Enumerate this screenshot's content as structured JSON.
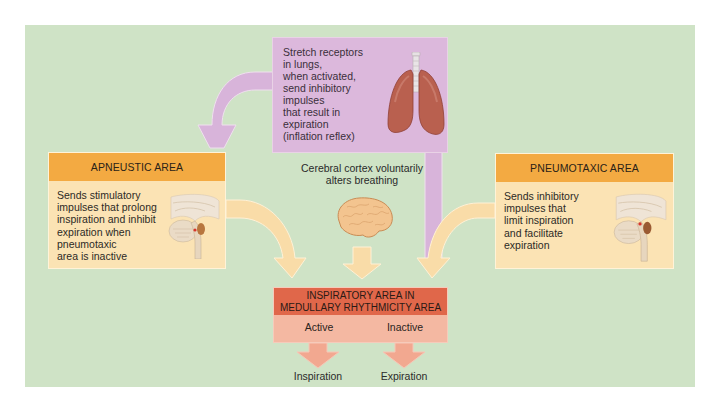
{
  "diagram": {
    "type": "flowchart",
    "topic": "Regulation of breathing by brain stem respiratory centers",
    "colors": {
      "panel_background": "#cfe3c6",
      "stretch_receptor_box": "#dcb8dc",
      "area_box_header": "#f3aa42",
      "area_box_body": "#fbe3b4",
      "inspiratory_header": "#e0674a",
      "inspiratory_body": "#f4b8a2",
      "arrow_yellow": "#f9dca8",
      "arrow_purple": "#d8b4da",
      "arrow_salmon": "#f2a890"
    }
  },
  "stretch_receptors": {
    "text": "Stretch receptors in lungs, when activated, send inhibitory impulses that result in expiration (inflation reflex)",
    "lines": [
      "Stretch receptors",
      "in lungs,",
      "when activated,",
      "send inhibitory",
      "impulses",
      "that result in",
      "expiration",
      "(inflation reflex)"
    ],
    "icon": "lungs-icon"
  },
  "apneustic_area": {
    "title": "APNEUSTIC AREA",
    "lines": [
      "Sends stimulatory",
      "impulses that prolong",
      "inspiration and inhibit",
      "expiration when",
      "pneumotaxic",
      "area is inactive"
    ],
    "icon": "brainstem-icon"
  },
  "pneumotaxic_area": {
    "title": "PNEUMOTAXIC AREA",
    "lines": [
      "Sends inhibitory",
      "impulses that",
      "limit inspiration",
      "and facilitate",
      "expiration"
    ],
    "icon": "brainstem-icon"
  },
  "cerebral_cortex": {
    "lines": [
      "Cerebral cortex voluntarily",
      "alters breathing"
    ],
    "icon": "brain-icon"
  },
  "inspiratory_area": {
    "title_lines": [
      "INSPIRATORY AREA IN",
      "MEDULLARY RHYTHMICITY AREA"
    ],
    "states": [
      "Active",
      "Inactive"
    ]
  },
  "outcomes": [
    "Inspiration",
    "Expiration"
  ],
  "connections": [
    {
      "from": "stretch_receptors",
      "to": "apneustic_area",
      "style": "purple-curved-arrow"
    },
    {
      "from": "stretch_receptors",
      "to": "inspiratory_area",
      "style": "purple-stem"
    },
    {
      "from": "apneustic_area",
      "to": "inspiratory_area",
      "style": "yellow-curved-arrow"
    },
    {
      "from": "cerebral_cortex",
      "to": "inspiratory_area",
      "style": "yellow-down-arrow"
    },
    {
      "from": "pneumotaxic_area",
      "to": "inspiratory_area",
      "style": "yellow-curved-arrow"
    },
    {
      "from": "inspiratory_area.Active",
      "to": "Inspiration",
      "style": "salmon-down-arrow"
    },
    {
      "from": "inspiratory_area.Inactive",
      "to": "Expiration",
      "style": "salmon-down-arrow"
    }
  ]
}
